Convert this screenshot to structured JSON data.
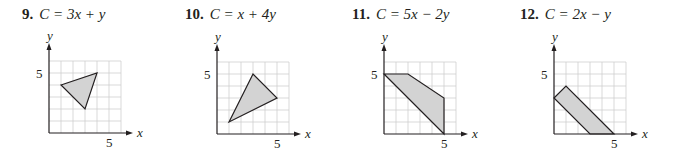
{
  "problems": [
    {
      "number": "9.",
      "expression": "C = 3x + y",
      "left": 0,
      "header_x": 22,
      "origin": [
        49,
        133
      ],
      "vertices": [
        [
          1,
          4
        ],
        [
          4,
          5
        ],
        [
          3,
          2
        ]
      ]
    },
    {
      "number": "10.",
      "expression": "C = x + 4y",
      "left": 168,
      "header_x": 17,
      "origin": [
        49,
        134
      ],
      "vertices": [
        [
          1,
          1
        ],
        [
          3,
          5
        ],
        [
          5,
          3
        ]
      ]
    },
    {
      "number": "11.",
      "expression": "C = 5x − 2y",
      "left": 336,
      "header_x": 16,
      "origin": [
        48,
        134
      ],
      "vertices": [
        [
          0,
          5
        ],
        [
          2,
          5
        ],
        [
          5,
          3
        ],
        [
          5,
          0
        ]
      ]
    },
    {
      "number": "12.",
      "expression": "C = 2x − y",
      "left": 504,
      "header_x": 16,
      "origin": [
        50,
        134
      ],
      "vertices": [
        [
          0,
          3
        ],
        [
          1,
          4
        ],
        [
          5,
          0
        ],
        [
          3,
          0
        ]
      ]
    }
  ],
  "axes": {
    "x_label": "x",
    "y_label": "y",
    "x_tick": "5",
    "y_tick": "5"
  },
  "grid": {
    "unit_px": 12,
    "cells": 6
  },
  "colors": {
    "region_fill": "#d3d3d3",
    "grid": "#cfcfcf",
    "ink": "#231f20"
  },
  "chart_data": [
    {
      "type": "diagram",
      "title": "9. C = 3x + y",
      "xlabel": "x",
      "ylabel": "y",
      "xlim": [
        0,
        6
      ],
      "ylim": [
        0,
        6
      ],
      "grid": true,
      "feasible_region": [
        [
          1,
          4
        ],
        [
          4,
          5
        ],
        [
          3,
          2
        ]
      ]
    },
    {
      "type": "diagram",
      "title": "10. C = x + 4y",
      "xlabel": "x",
      "ylabel": "y",
      "xlim": [
        0,
        6
      ],
      "ylim": [
        0,
        6
      ],
      "grid": true,
      "feasible_region": [
        [
          1,
          1
        ],
        [
          3,
          5
        ],
        [
          5,
          3
        ]
      ]
    },
    {
      "type": "diagram",
      "title": "11. C = 5x − 2y",
      "xlabel": "x",
      "ylabel": "y",
      "xlim": [
        0,
        6
      ],
      "ylim": [
        0,
        6
      ],
      "grid": true,
      "feasible_region": [
        [
          0,
          5
        ],
        [
          2,
          5
        ],
        [
          5,
          3
        ],
        [
          5,
          0
        ]
      ]
    },
    {
      "type": "diagram",
      "title": "12. C = 2x − y",
      "xlabel": "x",
      "ylabel": "y",
      "xlim": [
        0,
        6
      ],
      "ylim": [
        0,
        6
      ],
      "grid": true,
      "feasible_region": [
        [
          0,
          3
        ],
        [
          1,
          4
        ],
        [
          5,
          0
        ],
        [
          3,
          0
        ]
      ]
    }
  ]
}
